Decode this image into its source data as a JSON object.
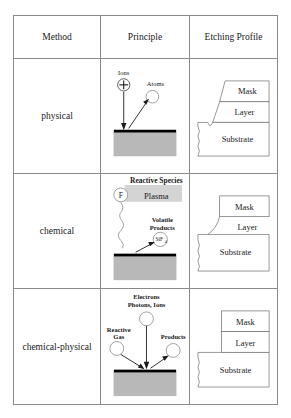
{
  "figure": {
    "kind": "comparison-table",
    "columns": [
      "Method",
      "Principle",
      "Etching Profile"
    ],
    "header": {
      "method": "Method",
      "principle": "Principle",
      "profile": "Etching Profile"
    },
    "stack_labels": {
      "mask": "Mask",
      "layer": "Layer",
      "substrate": "Substrate"
    },
    "rows": [
      {
        "id": "physical",
        "method": "physical",
        "principle": {
          "incoming_label": "Ions",
          "incoming_symbol": "+",
          "outgoing_label": "Atoms",
          "surface": "substrate-block"
        },
        "profile": {
          "type": "anisotropic-sloped-sidewall",
          "mask": "Mask",
          "layer": "Layer",
          "substrate": "Substrate"
        }
      },
      {
        "id": "chemical",
        "method": "chemical",
        "principle": {
          "reactive_species_label": "Reactive Species",
          "reactive_species_symbol": "F",
          "plasma_label": "Plasma",
          "products_label_line1": "Volatile",
          "products_label_line2": "Products",
          "products_symbol": "SiF",
          "products_symbol_subscript": "4",
          "surface": "substrate-block"
        },
        "profile": {
          "type": "isotropic-undercut",
          "mask": "Mask",
          "layer": "Layer",
          "substrate": "Substrate"
        }
      },
      {
        "id": "chemical-physical",
        "method": "chemical-physical",
        "principle": {
          "incoming_label_line1": "Electrons",
          "incoming_label_line2": "Photons, Ions",
          "reactive_label_line1": "Reactive",
          "reactive_label_line2": "Gas",
          "products_label": "Products",
          "surface": "substrate-block"
        },
        "profile": {
          "type": "vertical-sidewall",
          "mask": "Mask",
          "layer": "Layer",
          "substrate": "Substrate"
        }
      }
    ]
  },
  "colors": {
    "border": "#8a8a8a",
    "substrate_fill": "#b8b8b8",
    "surface_line": "#000000",
    "plasma_band": "#d4d4d4",
    "text": "#1a1a1a",
    "page": "#ffffff"
  }
}
